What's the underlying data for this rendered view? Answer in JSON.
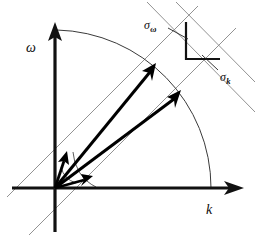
{
  "figure": {
    "kind": "vector-diagram",
    "background_color": "#ffffff",
    "ink_color": "#000000",
    "guide_color": "#8c8c8c",
    "arc_color": "#3a3a3a"
  },
  "axes": {
    "origin": {
      "x": 55,
      "y": 188
    },
    "vertical": {
      "label": "ω",
      "name": "omega-axis",
      "from": {
        "x": 55,
        "y": 231
      },
      "to": {
        "x": 55,
        "y": 25
      },
      "label_pos": {
        "x": 26,
        "y": 41
      }
    },
    "horizontal": {
      "label": "k",
      "name": "k-axis",
      "from": {
        "x": 12,
        "y": 188
      },
      "to": {
        "x": 243,
        "y": 188
      },
      "label_pos": {
        "x": 206,
        "y": 203
      }
    }
  },
  "annotations": {
    "sigma_omega": {
      "label": "σ",
      "subscript": "ω",
      "label_pos": {
        "x": 144,
        "y": 19
      },
      "leader_from": {
        "x": 170,
        "y": 31
      },
      "leader_to": {
        "x": 187,
        "y": 39
      }
    },
    "sigma_k": {
      "label": "σ",
      "subscript": "k",
      "label_pos": {
        "x": 220,
        "y": 71
      },
      "leader_from": {
        "x": 219,
        "y": 69
      },
      "leader_to": {
        "x": 203,
        "y": 56
      }
    }
  },
  "arcs": {
    "major": {
      "name": "unit-magnitude-arc",
      "radius": 156,
      "start_angle_deg": 90,
      "end_angle_deg": 0
    },
    "angle_inner": {
      "name": "inner-angle-arc",
      "radius": 22,
      "start_angle_deg": 72,
      "end_angle_deg": 14
    },
    "angle_outer": {
      "name": "outer-angle-arc",
      "radius": 41,
      "start_angle_deg": 62,
      "end_angle_deg": 2
    }
  },
  "vectors": [
    {
      "name": "vector-short-steep",
      "tip": {
        "x": 66,
        "y": 153
      },
      "angle_deg": 72,
      "length": 36,
      "style": "short"
    },
    {
      "name": "vector-short-shallow",
      "tip": {
        "x": 91,
        "y": 177
      },
      "angle_deg": 15,
      "length": 37,
      "style": "short"
    },
    {
      "name": "vector-long-steep",
      "tip": {
        "x": 154,
        "y": 66
      },
      "angle_deg": 48,
      "length": 152,
      "style": "long"
    },
    {
      "name": "vector-long-shallow",
      "tip": {
        "x": 179,
        "y": 93
      },
      "angle_deg": 38,
      "length": 155,
      "style": "long"
    }
  ],
  "sigma_lines": {
    "omega_family": {
      "name": "sigma-omega-parallel-lines",
      "angle_deg": 45,
      "line_a": {
        "x1": 8,
        "y1": 196,
        "x2": 196,
        "y2": 8
      },
      "line_b": {
        "x1": 30,
        "y1": 232,
        "x2": 232,
        "y2": 30
      }
    },
    "k_family": {
      "name": "sigma-k-parallel-lines",
      "angle_deg": 45,
      "line_a": {
        "x1": 150,
        "y1": 2,
        "x2": 255,
        "y2": 110
      },
      "line_b": {
        "x1": 176,
        "y1": 2,
        "x2": 255,
        "y2": 82
      }
    }
  },
  "bracket": {
    "name": "right-angle-bracket",
    "points": "186,24 186,59 219,59"
  }
}
